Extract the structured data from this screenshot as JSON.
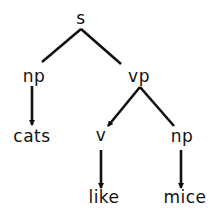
{
  "diagram": {
    "type": "parse-tree",
    "line_color": "#111111",
    "nodes": [
      {
        "id": "s",
        "label": "s",
        "x": 81,
        "y": 10
      },
      {
        "id": "np1",
        "label": "np",
        "x": 34,
        "y": 70
      },
      {
        "id": "vp",
        "label": "vp",
        "x": 139,
        "y": 70
      },
      {
        "id": "cats",
        "label": "cats",
        "x": 32,
        "y": 128
      },
      {
        "id": "v",
        "label": "v",
        "x": 101,
        "y": 128
      },
      {
        "id": "np2",
        "label": "np",
        "x": 182,
        "y": 128
      },
      {
        "id": "like",
        "label": "like",
        "x": 104,
        "y": 190
      },
      {
        "id": "mice",
        "label": "mice",
        "x": 185,
        "y": 190
      }
    ],
    "edges": [
      {
        "from": "s",
        "to": "np1",
        "x1": 81,
        "y1": 29,
        "x2": 42,
        "y2": 62,
        "arrow": false
      },
      {
        "from": "s",
        "to": "vp",
        "x1": 81,
        "y1": 29,
        "x2": 121,
        "y2": 64,
        "arrow": false
      },
      {
        "from": "np1",
        "to": "cats",
        "x1": 32,
        "y1": 86,
        "x2": 32,
        "y2": 125,
        "arrow": true
      },
      {
        "from": "vp",
        "to": "v",
        "x1": 140,
        "y1": 87,
        "x2": 108,
        "y2": 126,
        "arrow": true
      },
      {
        "from": "vp",
        "to": "np2",
        "x1": 140,
        "y1": 87,
        "x2": 174,
        "y2": 126,
        "arrow": false
      },
      {
        "from": "v",
        "to": "like",
        "x1": 101,
        "y1": 150,
        "x2": 101,
        "y2": 188,
        "arrow": true
      },
      {
        "from": "np2",
        "to": "mice",
        "x1": 181,
        "y1": 150,
        "x2": 181,
        "y2": 188,
        "arrow": true
      }
    ]
  }
}
